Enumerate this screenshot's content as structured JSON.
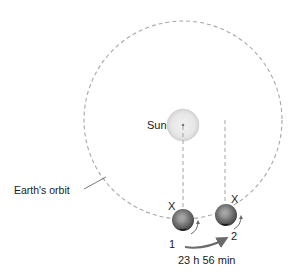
{
  "diagram": {
    "type": "sidereal-vs-solar-day",
    "labels": {
      "sun": "Sun",
      "orbit": "Earth's orbit",
      "marker_1": "X",
      "marker_2": "X",
      "position_1": "1",
      "position_2": "2",
      "duration": "23 h 56 min"
    },
    "colors": {
      "orbit_dash": "#a8a8a8",
      "sun_fill": "#e8e8e8",
      "sun_edge": "#c8c8c8",
      "earth_light": "#b0b0b0",
      "earth_dark": "#4a4a4a",
      "arrow": "#6a6a6a",
      "text": "#1a1a1a"
    },
    "elements": {
      "orbit": {
        "cx": 183,
        "cy": 120,
        "r": 99
      },
      "sun": {
        "cx": 183,
        "cy": 125,
        "r": 16
      },
      "earth_1": {
        "cx": 183,
        "cy": 220,
        "r": 11
      },
      "earth_2": {
        "cx": 226,
        "cy": 215,
        "r": 11
      }
    }
  }
}
